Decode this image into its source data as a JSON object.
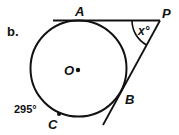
{
  "figure": {
    "part_label": "b.",
    "points": {
      "A": "A",
      "P": "P",
      "O": "O",
      "B": "B",
      "C": "C"
    },
    "angle_label": "x°",
    "arc_label": "295°",
    "colors": {
      "stroke": "#111111",
      "background": "#ffffff"
    }
  }
}
